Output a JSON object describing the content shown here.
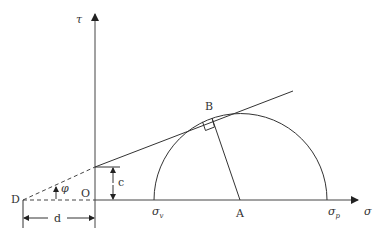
{
  "diagram": {
    "axis_y_label": "τ",
    "axis_x_label": "σ",
    "origin_label": "O",
    "point_d_label": "D",
    "point_b_label": "B",
    "point_a_label": "A",
    "sigma_v_label": "σ",
    "sigma_v_sub": "v",
    "sigma_p_label": "σ",
    "sigma_p_sub": "p",
    "cohesion_label": "c",
    "distance_label": "d",
    "angle_label": "φ",
    "caption": ""
  },
  "colors": {
    "line": "#333333",
    "background": "#ffffff"
  }
}
